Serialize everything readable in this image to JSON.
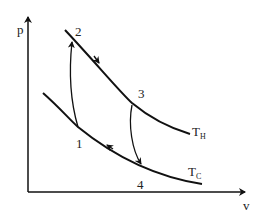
{
  "diagram": {
    "axes": {
      "y_label": "p",
      "x_label": "v"
    },
    "isotherms": [
      {
        "name": "hot",
        "label_main": "T",
        "label_sub": "H"
      },
      {
        "name": "cold",
        "label_main": "T",
        "label_sub": "C"
      }
    ],
    "points": [
      {
        "id": "1",
        "label": "1"
      },
      {
        "id": "2",
        "label": "2"
      },
      {
        "id": "3",
        "label": "3"
      },
      {
        "id": "4",
        "label": "4"
      }
    ],
    "processes": [
      {
        "from": "1",
        "to": "2",
        "type": "adiabatic compression"
      },
      {
        "from": "2",
        "to": "3",
        "type": "isothermal expansion at T_H"
      },
      {
        "from": "3",
        "to": "4",
        "type": "adiabatic expansion"
      },
      {
        "from": "4",
        "to": "1",
        "type": "isothermal compression at T_C"
      }
    ],
    "colors": {
      "line": "#111111",
      "background": "#ffffff"
    }
  }
}
